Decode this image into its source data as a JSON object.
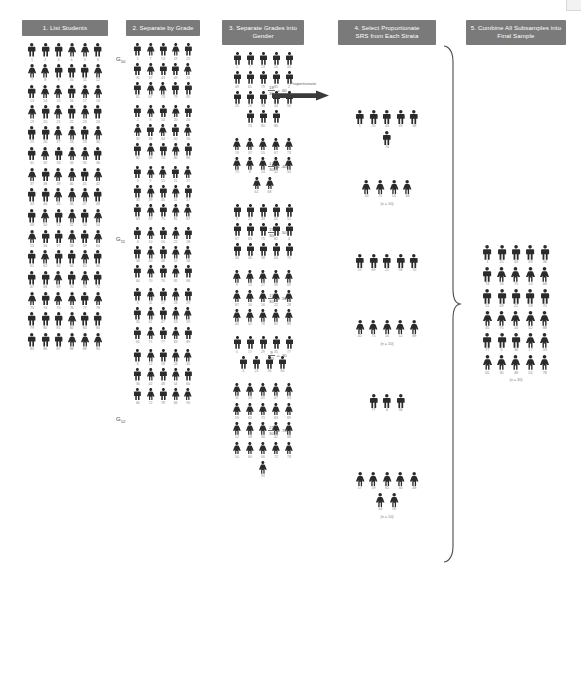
{
  "meta": {
    "diagram_title": "Proportionate Stratified Random Sampling",
    "background_color": "#ffffff",
    "header_color": "#7a7a7a",
    "figure_color": "#2b2b2b",
    "label_color": "#8a8a8a"
  },
  "columns": [
    {
      "id": "col1",
      "header": "1. List Students"
    },
    {
      "id": "col2",
      "header": "2. Separate by Grade"
    },
    {
      "id": "col3",
      "header": "3. Separate Grades into Gender"
    },
    {
      "id": "col4",
      "header": "4. Select Proportionate\nSRS from Each Strata"
    },
    {
      "id": "col5",
      "header": "5. Combine All Subsamples into\nFinal Sample"
    }
  ],
  "col1": {
    "grade_labels": [
      {
        "text": "G",
        "sub": "10"
      },
      {
        "text": "G",
        "sub": "11"
      },
      {
        "text": "G",
        "sub": "12"
      }
    ],
    "rows": [
      {
        "genders": [
          "m",
          "m",
          "m",
          "f",
          "f",
          "m"
        ],
        "labels": [
          "1",
          "2",
          "3",
          "4",
          "5",
          "6"
        ]
      },
      {
        "genders": [
          "f",
          "f",
          "m",
          "m",
          "m",
          "f"
        ],
        "labels": [
          "7",
          "8",
          "9",
          "10",
          "11",
          "12"
        ]
      },
      {
        "genders": [
          "m",
          "f",
          "f",
          "m",
          "f",
          "f"
        ],
        "labels": [
          "13",
          "14",
          "15",
          "16",
          "17",
          "18"
        ]
      },
      {
        "genders": [
          "f",
          "m",
          "f",
          "m",
          "f",
          "m"
        ],
        "labels": [
          "19",
          "20",
          "21",
          "22",
          "23",
          "24"
        ]
      },
      {
        "genders": [
          "m",
          "m",
          "f",
          "f",
          "m",
          "f"
        ],
        "labels": [
          "25",
          "26",
          "27",
          "28",
          "29",
          "30"
        ]
      },
      {
        "genders": [
          "m",
          "f",
          "m",
          "f",
          "f",
          "m"
        ],
        "labels": [
          "31",
          "32",
          "33",
          "34",
          "35",
          "36"
        ]
      },
      {
        "genders": [
          "f",
          "m",
          "f",
          "f",
          "m",
          "f"
        ],
        "labels": [
          "37",
          "38",
          "39",
          "40",
          "41",
          "42"
        ]
      },
      {
        "genders": [
          "m",
          "m",
          "f",
          "f",
          "f",
          "m"
        ],
        "labels": [
          "43",
          "44",
          "45",
          "46",
          "47",
          "48"
        ]
      },
      {
        "genders": [
          "m",
          "f",
          "m",
          "f",
          "m",
          "f"
        ],
        "labels": [
          "49",
          "50",
          "51",
          "52",
          "53",
          "54"
        ]
      },
      {
        "genders": [
          "f",
          "m",
          "m",
          "f",
          "m",
          "f"
        ],
        "labels": [
          "55",
          "56",
          "57",
          "58",
          "59",
          "60"
        ]
      },
      {
        "genders": [
          "m",
          "f",
          "m",
          "m",
          "f",
          "m"
        ],
        "labels": [
          "61",
          "62",
          "63",
          "64",
          "65",
          "66"
        ]
      },
      {
        "genders": [
          "m",
          "m",
          "f",
          "m",
          "f",
          "m"
        ],
        "labels": [
          "67",
          "68",
          "69",
          "70",
          "71",
          "72"
        ]
      },
      {
        "genders": [
          "f",
          "m",
          "f",
          "f",
          "m",
          "f"
        ],
        "labels": [
          "73",
          "74",
          "75",
          "76",
          "77",
          "78"
        ]
      },
      {
        "genders": [
          "m",
          "m",
          "m",
          "f",
          "m",
          "m"
        ],
        "labels": [
          "79",
          "80",
          "81",
          "82",
          "83",
          "84"
        ]
      },
      {
        "genders": [
          "m",
          "m",
          "m",
          "f",
          "f",
          "f"
        ],
        "labels": [
          "85",
          "86",
          "87",
          "88",
          "89",
          "90"
        ]
      }
    ]
  },
  "col2": {
    "rows": [
      {
        "genders": [
          "m",
          "f",
          "m",
          "f",
          "m"
        ],
        "labels": [
          "1",
          "7",
          "13",
          "19",
          "25"
        ]
      },
      {
        "genders": [
          "m",
          "f",
          "m",
          "m",
          "f"
        ],
        "labels": [
          "31",
          "37",
          "43",
          "49",
          "55"
        ]
      },
      {
        "genders": [
          "m",
          "f",
          "f",
          "m",
          "m"
        ],
        "labels": [
          "61",
          "67",
          "73",
          "79",
          "85"
        ]
      },
      {
        "genders": [
          "m",
          "f",
          "m",
          "f",
          "m"
        ],
        "labels": [
          "2",
          "8",
          "14",
          "20",
          "26"
        ]
      },
      {
        "genders": [
          "f",
          "m",
          "f",
          "m",
          "f"
        ],
        "labels": [
          "32",
          "38",
          "44",
          "50",
          "56"
        ]
      },
      {
        "genders": [
          "m",
          "f",
          "m",
          "f",
          "m"
        ],
        "labels": [
          "62",
          "68",
          "74",
          "80",
          "86"
        ]
      },
      {
        "genders": [
          "m",
          "f",
          "f",
          "m",
          "f"
        ],
        "labels": [
          "3",
          "9",
          "15",
          "21",
          "27"
        ]
      },
      {
        "genders": [
          "m",
          "f",
          "m",
          "f",
          "m"
        ],
        "labels": [
          "33",
          "39",
          "45",
          "51",
          "57"
        ]
      },
      {
        "genders": [
          "m",
          "f",
          "m",
          "f",
          "f"
        ],
        "labels": [
          "63",
          "69",
          "75",
          "81",
          "87"
        ]
      },
      {
        "genders": [
          "m",
          "f",
          "m",
          "f",
          "m"
        ],
        "labels": [
          "4",
          "10",
          "16",
          "22",
          "28"
        ]
      },
      {
        "genders": [
          "m",
          "f",
          "m",
          "f",
          "f"
        ],
        "labels": [
          "34",
          "40",
          "46",
          "52",
          "58"
        ]
      },
      {
        "genders": [
          "m",
          "f",
          "m",
          "f",
          "m"
        ],
        "labels": [
          "64",
          "70",
          "76",
          "82",
          "88"
        ]
      },
      {
        "genders": [
          "m",
          "f",
          "m",
          "f",
          "m"
        ],
        "labels": [
          "5",
          "11",
          "17",
          "23",
          "29"
        ]
      },
      {
        "genders": [
          "m",
          "f",
          "m",
          "f",
          "f"
        ],
        "labels": [
          "35",
          "41",
          "47",
          "53",
          "59"
        ]
      },
      {
        "genders": [
          "m",
          "f",
          "m",
          "f",
          "m"
        ],
        "labels": [
          "65",
          "71",
          "77",
          "83",
          "89"
        ]
      },
      {
        "genders": [
          "m",
          "f",
          "m",
          "f",
          "f"
        ],
        "labels": [
          "6",
          "12",
          "18",
          "24",
          "30"
        ]
      },
      {
        "genders": [
          "m",
          "f",
          "m",
          "f",
          "m"
        ],
        "labels": [
          "36",
          "42",
          "48",
          "54",
          "60"
        ]
      },
      {
        "genders": [
          "m",
          "f",
          "m",
          "f",
          "f"
        ],
        "labels": [
          "66",
          "72",
          "78",
          "84",
          "90"
        ]
      }
    ]
  },
  "col3": {
    "proportionate_label": "Proportionate",
    "groups": [
      {
        "id": "g10-male",
        "fraction": {
          "num": "18",
          "den": "30",
          "equals": "= .60"
        },
        "rows": [
          {
            "genders": [
              "m",
              "m",
              "m",
              "m",
              "m"
            ],
            "labels": [
              "1",
              "7",
              "13",
              "25",
              "43"
            ]
          },
          {
            "genders": [
              "m",
              "m",
              "m",
              "m",
              "m"
            ],
            "labels": [
              "49",
              "61",
              "79",
              "85",
              "2"
            ]
          },
          {
            "genders": [
              "m",
              "m",
              "m",
              "m",
              "m"
            ],
            "labels": [
              "20",
              "26",
              "38",
              "44",
              "56"
            ]
          },
          {
            "genders": [
              "m",
              "m",
              "m"
            ],
            "labels": [
              "74",
              "80",
              "86"
            ]
          }
        ]
      },
      {
        "id": "g10-female",
        "fraction": {
          "num": "12",
          "den": "30",
          "equals": "= .40"
        },
        "rows": [
          {
            "genders": [
              "f",
              "f",
              "f",
              "f",
              "f"
            ],
            "labels": [
              "19",
              "37",
              "55",
              "67",
              "73"
            ]
          },
          {
            "genders": [
              "f",
              "f",
              "f",
              "f",
              "f"
            ],
            "labels": [
              "75",
              "8",
              "14",
              "32",
              "50"
            ]
          },
          {
            "genders": [
              "f",
              "f"
            ],
            "labels": [
              "62",
              "68"
            ]
          }
        ]
      },
      {
        "id": "g11-male",
        "fraction": {
          "num": "15",
          "den": "30",
          "equals": "= .50"
        },
        "rows": [
          {
            "genders": [
              "m",
              "m",
              "m",
              "m",
              "m"
            ],
            "labels": [
              "3",
              "21",
              "33",
              "45",
              "51"
            ]
          },
          {
            "genders": [
              "m",
              "m",
              "m",
              "m",
              "m"
            ],
            "labels": [
              "57",
              "63",
              "75",
              "81",
              "4"
            ]
          },
          {
            "genders": [
              "m",
              "m",
              "m",
              "m",
              "m"
            ],
            "labels": [
              "34",
              "46",
              "58",
              "64",
              "70"
            ]
          }
        ]
      },
      {
        "id": "g11-female",
        "fraction": {
          "num": "15",
          "den": "30",
          "equals": "= .50"
        },
        "rows": [
          {
            "genders": [
              "f",
              "f",
              "f",
              "f",
              "f"
            ],
            "labels": [
              "9",
              "15",
              "27",
              "39",
              "69"
            ]
          },
          {
            "genders": [
              "f",
              "f",
              "f",
              "f",
              "f"
            ],
            "labels": [
              "87",
              "10",
              "16",
              "22",
              "28"
            ]
          },
          {
            "genders": [
              "f",
              "f",
              "f",
              "f",
              "f"
            ],
            "labels": [
              "40",
              "52",
              "76",
              "82",
              "88"
            ]
          }
        ]
      },
      {
        "id": "g12-male",
        "fraction": {
          "num": "9",
          "den": "30",
          "equals": "= .30"
        },
        "rows": [
          {
            "genders": [
              "m",
              "m",
              "m",
              "m",
              "m"
            ],
            "labels": [
              "5",
              "17",
              "29",
              "35",
              "77"
            ]
          },
          {
            "genders": [
              "m",
              "m",
              "m",
              "m"
            ],
            "labels": [
              "6",
              "24",
              "36",
              "84"
            ]
          }
        ]
      },
      {
        "id": "g12-female",
        "fraction": {
          "num": "21",
          "den": "30",
          "equals": "= .70"
        },
        "rows": [
          {
            "genders": [
              "f",
              "f",
              "f",
              "f",
              "f"
            ],
            "labels": [
              "11",
              "23",
              "41",
              "47",
              "53"
            ]
          },
          {
            "genders": [
              "f",
              "f",
              "f",
              "f",
              "f"
            ],
            "labels": [
              "59",
              "65",
              "71",
              "83",
              "89"
            ]
          },
          {
            "genders": [
              "f",
              "f",
              "f",
              "f",
              "f"
            ],
            "labels": [
              "12",
              "18",
              "30",
              "42",
              "48"
            ]
          },
          {
            "genders": [
              "f",
              "f",
              "f",
              "f",
              "f"
            ],
            "labels": [
              "54",
              "60",
              "66",
              "72",
              "78"
            ]
          },
          {
            "genders": [
              "f"
            ],
            "labels": [
              "90"
            ]
          }
        ]
      }
    ]
  },
  "col4": {
    "groups": [
      {
        "id": "subsample-g10-male",
        "rows": [
          {
            "genders": [
              "m",
              "m",
              "m",
              "m",
              "m"
            ],
            "labels": [
              "1",
              "25",
              "43",
              "49",
              "38"
            ]
          },
          {
            "genders": [
              "m"
            ],
            "labels": [
              "74"
            ]
          }
        ],
        "note": ""
      },
      {
        "id": "subsample-g10-female",
        "rows": [
          {
            "genders": [
              "f",
              "f",
              "f",
              "f"
            ],
            "labels": [
              "33",
              "75",
              "14",
              "68"
            ]
          }
        ],
        "note": "(n = 10)"
      },
      {
        "id": "subsample-g11-male",
        "rows": [
          {
            "genders": [
              "m",
              "m",
              "m",
              "m",
              "m"
            ],
            "labels": [
              "51",
              "69",
              "22",
              "58",
              "70"
            ]
          }
        ],
        "note": ""
      },
      {
        "id": "subsample-g11-female",
        "rows": [
          {
            "genders": [
              "f",
              "f",
              "f",
              "f",
              "f"
            ],
            "labels": [
              "45",
              "75",
              "10",
              "52",
              "88"
            ]
          }
        ],
        "note": "(n = 10)"
      },
      {
        "id": "subsample-g12-male",
        "rows": [
          {
            "genders": [
              "m",
              "m",
              "m"
            ],
            "labels": [
              "77",
              "6",
              "36"
            ]
          }
        ],
        "note": ""
      },
      {
        "id": "subsample-g12-female",
        "rows": [
          {
            "genders": [
              "f",
              "f",
              "f",
              "f",
              "f"
            ],
            "labels": [
              "17",
              "59",
              "65",
              "30",
              "48"
            ]
          },
          {
            "genders": [
              "f",
              "f"
            ],
            "labels": [
              "54",
              "78"
            ]
          }
        ],
        "note": "(n = 10)"
      }
    ]
  },
  "col5": {
    "rows": [
      {
        "genders": [
          "m",
          "m",
          "m",
          "m",
          "m"
        ],
        "labels": [
          "1",
          "25",
          "43",
          "49",
          "38"
        ]
      },
      {
        "genders": [
          "m",
          "f",
          "f",
          "f",
          "f"
        ],
        "labels": [
          "74",
          "33",
          "75",
          "14",
          "68"
        ]
      },
      {
        "genders": [
          "m",
          "m",
          "m",
          "m",
          "m"
        ],
        "labels": [
          "51",
          "69",
          "22",
          "58",
          "70"
        ]
      },
      {
        "genders": [
          "f",
          "f",
          "f",
          "f",
          "f"
        ],
        "labels": [
          "45",
          "75",
          "10",
          "52",
          "88"
        ]
      },
      {
        "genders": [
          "m",
          "m",
          "m",
          "f",
          "f"
        ],
        "labels": [
          "77",
          "6",
          "36",
          "17",
          "59"
        ]
      },
      {
        "genders": [
          "f",
          "f",
          "f",
          "f",
          "f"
        ],
        "labels": [
          "65",
          "30",
          "48",
          "54",
          "78"
        ]
      }
    ],
    "note": "(n = 30)"
  }
}
